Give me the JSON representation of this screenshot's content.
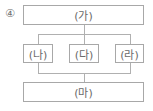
{
  "choice_number": "④",
  "diagram": {
    "top": {
      "label": "(가)"
    },
    "middle": [
      {
        "label": "(나)"
      },
      {
        "label": "(다)"
      },
      {
        "label": "(라)"
      }
    ],
    "bottom": {
      "label": "(마)"
    }
  }
}
